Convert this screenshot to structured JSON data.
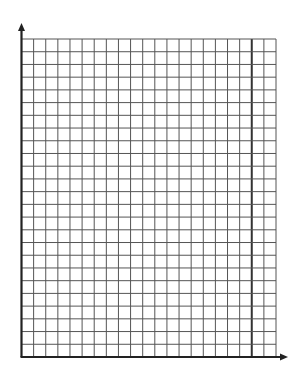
{
  "graph_paper": {
    "description": "Blank graph paper with x and y axes",
    "columns": 21,
    "rows": 25,
    "thick_column_line_index": 19,
    "grid": {
      "left": 21.5,
      "top": 39,
      "right": 276,
      "bottom": 357
    },
    "y_axis_arrow_tip": {
      "x": 21.5,
      "y": 23
    },
    "x_axis_arrow_tip": {
      "x": 288,
      "y": 357
    },
    "colors": {
      "background": "#ffffff",
      "grid_line": "#555555",
      "thick_line": "#333333",
      "axis": "#222222"
    }
  }
}
